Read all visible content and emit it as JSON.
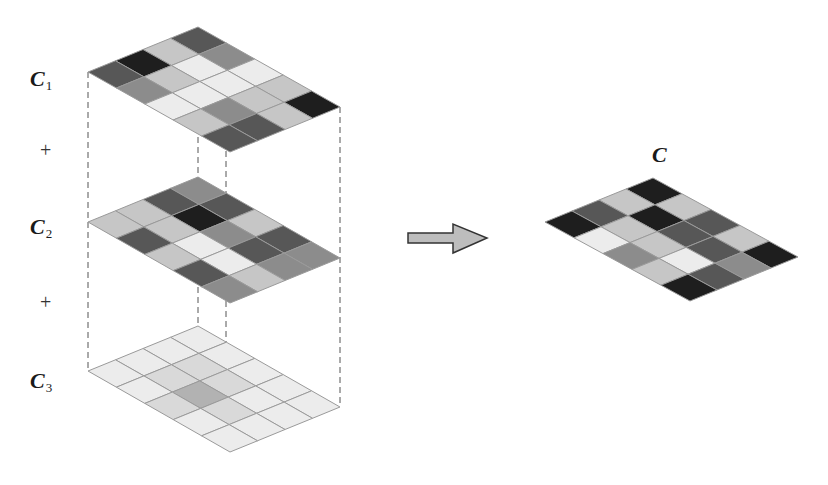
{
  "labels": {
    "c1": {
      "main": "C",
      "sub": "1"
    },
    "c2": {
      "main": "C",
      "sub": "2"
    },
    "c3": {
      "main": "C",
      "sub": "3"
    },
    "c": {
      "main": "C"
    },
    "plus1": "+",
    "plus2": "+"
  },
  "palette": {
    "black": "#1e1e1e",
    "dark": "#575757",
    "medium": "#8c8c8c",
    "light": "#c6c6c6",
    "pale": "#d9d9d9",
    "mid3": "#b2b2b2",
    "white": "#ececec",
    "grid_line": "#9a9a9a",
    "dash_line": "#555555",
    "arrow_fill": "#bdbdbd",
    "arrow_stroke": "#333333"
  },
  "grids": [
    {
      "id": "c1",
      "top": [
        198,
        27
      ],
      "left": [
        88,
        72
      ],
      "right": [
        340,
        107
      ],
      "cells": [
        [
          "dark",
          "medium",
          "white",
          "light",
          "black"
        ],
        [
          "light",
          "white",
          "white",
          "light",
          "light"
        ],
        [
          "black",
          "light",
          "white",
          "medium",
          "dark"
        ],
        [
          "dark",
          "medium",
          "white",
          "light",
          "dark"
        ]
      ]
    },
    {
      "id": "c2",
      "top": [
        198,
        177
      ],
      "left": [
        88,
        222
      ],
      "right": [
        340,
        258
      ],
      "cells": [
        [
          "medium",
          "dark",
          "light",
          "dark",
          "medium"
        ],
        [
          "dark",
          "black",
          "medium",
          "dark",
          "medium"
        ],
        [
          "light",
          "light",
          "white",
          "white",
          "light"
        ],
        [
          "light",
          "dark",
          "light",
          "dark",
          "medium"
        ]
      ]
    },
    {
      "id": "c3",
      "top": [
        198,
        326
      ],
      "left": [
        88,
        371
      ],
      "right": [
        340,
        407
      ],
      "cells": [
        [
          "white",
          "white",
          "white",
          "white",
          "white"
        ],
        [
          "white",
          "pale",
          "pale",
          "white",
          "white"
        ],
        [
          "white",
          "pale",
          "mid3",
          "pale",
          "white"
        ],
        [
          "white",
          "white",
          "pale",
          "white",
          "white"
        ]
      ]
    },
    {
      "id": "c",
      "top": [
        653,
        178
      ],
      "left": [
        545,
        222
      ],
      "right": [
        798,
        257
      ],
      "cells": [
        [
          "black",
          "light",
          "dark",
          "light",
          "black"
        ],
        [
          "light",
          "black",
          "dark",
          "dark",
          "medium"
        ],
        [
          "dark",
          "light",
          "light",
          "white",
          "dark"
        ],
        [
          "black",
          "white",
          "medium",
          "light",
          "black"
        ]
      ]
    }
  ],
  "dashed_lines": [
    {
      "x": 88,
      "y1": 72,
      "y2": 371
    },
    {
      "x": 198,
      "y1": 27,
      "y2": 326
    },
    {
      "x": 226,
      "y1": 151,
      "y2": 451
    },
    {
      "x": 340,
      "y1": 107,
      "y2": 407
    }
  ],
  "arrow": {
    "points": "408,233 453,233 453,224 487,238 453,253 453,243 408,243"
  }
}
